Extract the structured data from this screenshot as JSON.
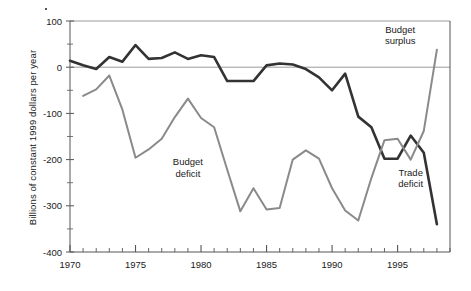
{
  "chart_data": {
    "type": "line",
    "title": "",
    "xlabel": "",
    "ylabel": "Billions of constant 1999 dollars per year",
    "xlim": [
      1970,
      1999
    ],
    "ylim": [
      -400,
      100
    ],
    "yticks": [
      100,
      0,
      -100,
      -200,
      -300,
      -400
    ],
    "ytick_labels": [
      "100",
      "0",
      "-100",
      "-200",
      "-300",
      "-400"
    ],
    "xticks": [
      1970,
      1975,
      1980,
      1985,
      1990,
      1995
    ],
    "xtick_labels": [
      "1970",
      "1975",
      "1980",
      "1985",
      "1990",
      "1995"
    ],
    "xtick_minor_step": 1,
    "grid": false,
    "zero_line": true,
    "legend_position": "inline-annotations",
    "annotations": [
      {
        "text": "Budget surplus",
        "lines": [
          "Budget",
          "surplus"
        ],
        "x": 1995.2,
        "y": 75
      },
      {
        "text": "Budget deficit",
        "lines": [
          "Budget",
          "deficit"
        ],
        "x": 1979.0,
        "y": -212
      },
      {
        "text": "Trade deficit",
        "lines": [
          "Trade",
          "deficit"
        ],
        "x": 1996.0,
        "y": -235
      }
    ],
    "series": [
      {
        "name": "Trade deficit",
        "color": "#333333",
        "width": 2.6,
        "x": [
          1970,
          1971,
          1972,
          1973,
          1974,
          1975,
          1976,
          1977,
          1978,
          1979,
          1980,
          1981,
          1982,
          1983,
          1984,
          1985,
          1986,
          1987,
          1988,
          1989,
          1990,
          1991,
          1992,
          1993,
          1994,
          1995,
          1996,
          1997,
          1998
        ],
        "values": [
          14,
          4,
          -4,
          22,
          12,
          48,
          18,
          20,
          32,
          18,
          26,
          22,
          -30,
          -30,
          -30,
          4,
          8,
          6,
          -4,
          -22,
          -50,
          -14,
          -107,
          -130,
          -198,
          -198,
          -148,
          -185,
          -340
        ]
      },
      {
        "name": "Budget deficit / surplus",
        "color": "#8a8a8a",
        "width": 2.0,
        "x": [
          1971,
          1972,
          1973,
          1974,
          1975,
          1976,
          1977,
          1978,
          1979,
          1980,
          1981,
          1982,
          1983,
          1984,
          1985,
          1986,
          1987,
          1988,
          1989,
          1990,
          1991,
          1992,
          1993,
          1994,
          1995,
          1996,
          1997,
          1998
        ],
        "values": [
          -62,
          -48,
          -18,
          -92,
          -196,
          -178,
          -155,
          -108,
          -68,
          -110,
          -130,
          -222,
          -312,
          -262,
          -308,
          -305,
          -200,
          -180,
          -198,
          -262,
          -310,
          -332,
          -240,
          -158,
          -155,
          -200,
          -138,
          38
        ]
      }
    ]
  },
  "axes": {
    "plot_left_px": 70,
    "plot_right_px": 450,
    "plot_top_px": 21,
    "plot_bottom_px": 252
  }
}
